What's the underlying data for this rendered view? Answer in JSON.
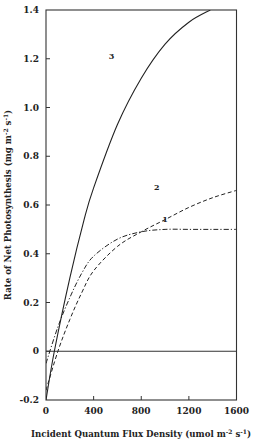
{
  "chart_data": {
    "type": "line",
    "title": "",
    "xlabel": "Incident Quantum Flux Density (umol m-2 s-1)",
    "ylabel": "Rate of Net Photosynthesis (mg m-2 s-1)",
    "xlim": [
      0,
      1600
    ],
    "ylim": [
      -0.2,
      1.4
    ],
    "xticks": [
      0,
      400,
      800,
      1200,
      1600
    ],
    "yticks": [
      -0.2,
      0,
      0.2,
      0.4,
      0.6,
      0.8,
      1.0,
      1.2,
      1.4
    ],
    "xtick_labels": [
      "0",
      "400",
      "800",
      "1200",
      "1600"
    ],
    "ytick_labels": [
      "-0.2",
      "0",
      "0.2",
      "0.4",
      "0.6",
      "0.8",
      "1.0",
      "1.2",
      "1.4"
    ],
    "grid": false,
    "legend": "none (curves labeled inline 1, 2, 3)",
    "reference_line": {
      "y": 0
    },
    "series": [
      {
        "name": "1",
        "style": "dash-dot",
        "x": [
          0,
          100,
          200,
          300,
          400,
          600,
          800,
          1000,
          1200,
          1400,
          1600
        ],
        "values": [
          -0.05,
          0.1,
          0.22,
          0.32,
          0.39,
          0.46,
          0.49,
          0.5,
          0.5,
          0.5,
          0.5
        ]
      },
      {
        "name": "2",
        "style": "dashed",
        "x": [
          0,
          100,
          200,
          300,
          400,
          600,
          800,
          1000,
          1200,
          1400,
          1600
        ],
        "values": [
          -0.16,
          0.0,
          0.13,
          0.24,
          0.33,
          0.43,
          0.49,
          0.54,
          0.59,
          0.63,
          0.66
        ]
      },
      {
        "name": "3",
        "style": "solid",
        "x": [
          0,
          70,
          200,
          320,
          400,
          600,
          800,
          1000,
          1200,
          1380
        ],
        "values": [
          -0.2,
          0.0,
          0.3,
          0.54,
          0.67,
          0.93,
          1.12,
          1.26,
          1.35,
          1.4
        ]
      }
    ],
    "annotations": [
      {
        "text": "1",
        "x": 1000,
        "y": 0.53
      },
      {
        "text": "2",
        "x": 930,
        "y": 0.66
      },
      {
        "text": "3",
        "x": 550,
        "y": 1.2
      }
    ]
  },
  "labels": {
    "xlabel_main": "Incident Quantum Flux Density (umol m",
    "xlabel_sup1": "-2",
    "xlabel_mid": " s",
    "xlabel_sup2": "-1",
    "xlabel_end": ")",
    "ylabel_main": "Rate of Net Photosynthesis (mg m",
    "ylabel_sup1": "-2",
    "ylabel_mid": " s",
    "ylabel_sup2": "-1",
    "ylabel_end": ")"
  }
}
